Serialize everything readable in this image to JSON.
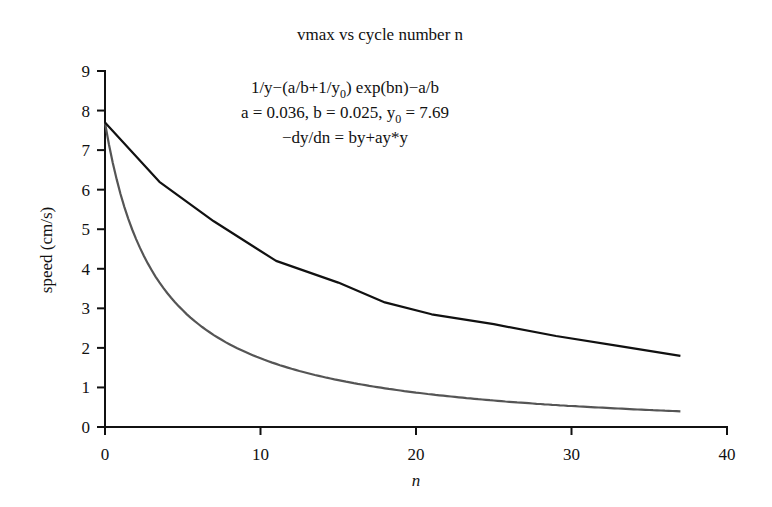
{
  "chart_data": {
    "type": "line",
    "title": "vmax vs cycle number n",
    "xlabel": "n",
    "ylabel": "speed (cm/s)",
    "xlim": [
      0,
      40
    ],
    "ylim": [
      0,
      9
    ],
    "xticks": [
      "0",
      "10",
      "20",
      "30",
      "40"
    ],
    "xtick_values": [
      0,
      10,
      20,
      30,
      40
    ],
    "yticks": [
      "0",
      "1",
      "2",
      "3",
      "4",
      "5",
      "6",
      "7",
      "8",
      "9"
    ],
    "ytick_values": [
      0,
      1,
      2,
      3,
      4,
      5,
      6,
      7,
      8,
      9
    ],
    "grid": false,
    "annotation": {
      "line1_pre": "1/y−(a/b+1/y",
      "line1_sub": "0",
      "line1_post": ") exp(bn)−a/b",
      "line2_pre": "a = 0.036, b = 0.025, y",
      "line2_sub": "0",
      "line2_post": " = 7.69",
      "line3": "−dy/dn = by+ay*y"
    },
    "model": {
      "a": 0.036,
      "b": 0.025,
      "y0": 7.69
    },
    "series": [
      {
        "name": "measured vmax",
        "color": "#111111",
        "x": [
          0,
          3.5,
          7,
          11,
          15,
          18,
          21,
          25,
          29,
          33,
          37
        ],
        "y": [
          7.7,
          6.2,
          5.2,
          4.2,
          3.65,
          3.15,
          2.85,
          2.6,
          2.3,
          2.05,
          1.8
        ]
      },
      {
        "name": "model fit",
        "color": "#555555",
        "x_range": [
          0,
          37
        ],
        "formula": "1/y = (a/b + 1/y0) exp(b n) - a/b"
      }
    ]
  }
}
